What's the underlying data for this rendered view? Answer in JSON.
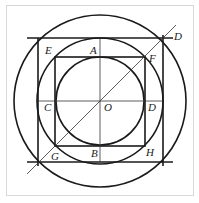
{
  "diagram": {
    "type": "geometry-construction",
    "colors": {
      "stroke": "#1a1a1a",
      "frame": "#d8d8d8",
      "background": "#ffffff"
    },
    "center": {
      "label": "O",
      "x": 100,
      "y": 101
    },
    "circles": [
      {
        "name": "inner",
        "r": 44
      },
      {
        "name": "middle",
        "r": 63
      },
      {
        "name": "outer",
        "r": 86
      }
    ],
    "squares": [
      {
        "name": "inner-square",
        "x1": 55,
        "y1": 57,
        "x2": 145,
        "y2": 146
      },
      {
        "name": "outer-square",
        "x1": 38,
        "y1": 38,
        "x2": 163,
        "y2": 162
      }
    ],
    "labels": {
      "A": "A",
      "B": "B",
      "C": "C",
      "D_top": "D",
      "D_mid": "D",
      "E": "E",
      "F": "F",
      "G": "G",
      "H": "H",
      "O": "O"
    }
  }
}
